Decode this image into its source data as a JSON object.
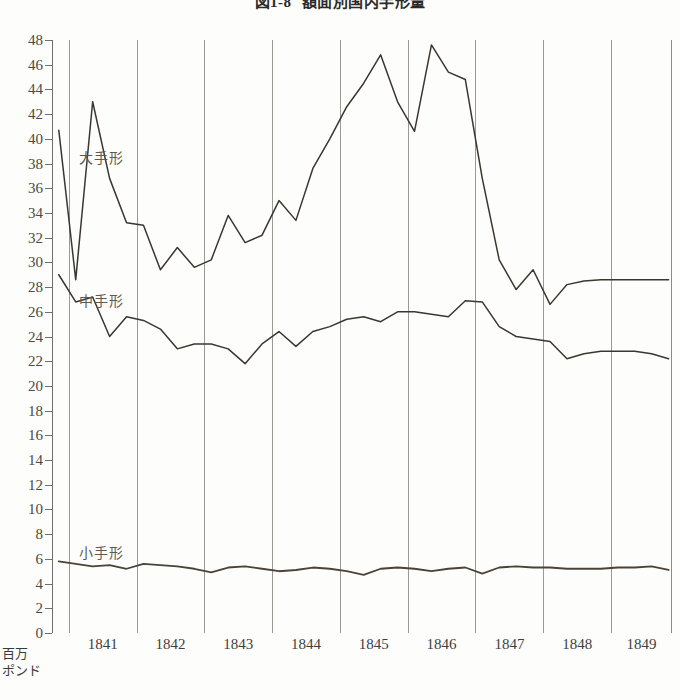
{
  "figure": {
    "title_number": "図1-8",
    "title_text": "額面別国内手形量",
    "unit_line1": "百万",
    "unit_line2": "ポンド"
  },
  "chart_data": {
    "type": "line",
    "xlabel": "",
    "ylabel": "百万ポンド",
    "ylim": [
      0,
      48
    ],
    "ytick_step": 2,
    "ytick_labels": [
      "0",
      "2",
      "4",
      "6",
      "8",
      "10",
      "12",
      "14",
      "16",
      "18",
      "20",
      "22",
      "24",
      "26",
      "28",
      "30",
      "32",
      "34",
      "36",
      "38",
      "40",
      "42",
      "44",
      "46",
      "48"
    ],
    "xlim": [
      1840.75,
      1849.9
    ],
    "categories": [
      "1841",
      "1842",
      "1843",
      "1844",
      "1845",
      "1846",
      "1847",
      "1848",
      "1849"
    ],
    "grid": "vertical-year-boundaries",
    "legend": "inline-labels",
    "series": [
      {
        "name": "大手形",
        "label_x": 1841.15,
        "label_y": 38.6,
        "color": "#3b3630",
        "x": [
          1840.85,
          1841.1,
          1841.35,
          1841.6,
          1841.85,
          1842.1,
          1842.35,
          1842.6,
          1842.85,
          1843.1,
          1843.35,
          1843.6,
          1843.85,
          1844.1,
          1844.35,
          1844.6,
          1844.85,
          1845.1,
          1845.35,
          1845.6,
          1845.85,
          1846.1,
          1846.35,
          1846.6,
          1846.85,
          1847.1,
          1847.35,
          1847.6,
          1847.85,
          1848.1,
          1848.35,
          1848.6,
          1848.85,
          1849.1,
          1849.35,
          1849.6,
          1849.85
        ],
        "values": [
          40.7,
          28.6,
          43.0,
          36.8,
          33.2,
          33.0,
          29.4,
          31.2,
          29.6,
          30.2,
          33.8,
          31.6,
          32.2,
          35.0,
          33.4,
          37.6,
          40.0,
          42.6,
          44.5,
          46.8,
          43.0,
          40.6,
          47.6,
          45.4,
          44.8,
          36.8,
          30.2,
          27.8,
          29.4,
          26.6,
          28.2,
          28.5,
          28.6,
          28.6,
          28.6,
          28.6,
          28.6
        ]
      },
      {
        "name": "中手形",
        "label_x": 1841.15,
        "label_y": 27.0,
        "color": "#3b3630",
        "x": [
          1840.85,
          1841.1,
          1841.35,
          1841.6,
          1841.85,
          1842.1,
          1842.35,
          1842.6,
          1842.85,
          1843.1,
          1843.35,
          1843.6,
          1843.85,
          1844.1,
          1844.35,
          1844.6,
          1844.85,
          1845.1,
          1845.35,
          1845.6,
          1845.85,
          1846.1,
          1846.35,
          1846.6,
          1846.85,
          1847.1,
          1847.35,
          1847.6,
          1847.85,
          1848.1,
          1848.35,
          1848.6,
          1848.85,
          1849.1,
          1849.35,
          1849.6,
          1849.85
        ],
        "values": [
          29.0,
          26.8,
          27.2,
          24.0,
          25.6,
          25.3,
          24.6,
          23.0,
          23.4,
          23.4,
          23.0,
          21.8,
          23.4,
          24.4,
          23.2,
          24.4,
          24.8,
          25.4,
          25.6,
          25.2,
          26.0,
          26.0,
          25.8,
          25.6,
          26.9,
          26.8,
          24.8,
          24.0,
          23.8,
          23.6,
          22.2,
          22.6,
          22.8,
          22.8,
          22.8,
          22.6,
          22.2
        ]
      },
      {
        "name": "小手形",
        "label_x": 1841.15,
        "label_y": 6.6,
        "color": "#4a4338",
        "x": [
          1840.85,
          1841.1,
          1841.35,
          1841.6,
          1841.85,
          1842.1,
          1842.35,
          1842.6,
          1842.85,
          1843.1,
          1843.35,
          1843.6,
          1843.85,
          1844.1,
          1844.35,
          1844.6,
          1844.85,
          1845.1,
          1845.35,
          1845.6,
          1845.85,
          1846.1,
          1846.35,
          1846.6,
          1846.85,
          1847.1,
          1847.35,
          1847.6,
          1847.85,
          1848.1,
          1848.35,
          1848.6,
          1848.85,
          1849.1,
          1849.35,
          1849.6,
          1849.85
        ],
        "values": [
          5.8,
          5.6,
          5.4,
          5.5,
          5.2,
          5.6,
          5.5,
          5.4,
          5.2,
          4.9,
          5.3,
          5.4,
          5.2,
          5.0,
          5.1,
          5.3,
          5.2,
          5.0,
          4.7,
          5.2,
          5.3,
          5.2,
          5.0,
          5.2,
          5.3,
          4.8,
          5.3,
          5.4,
          5.3,
          5.3,
          5.2,
          5.2,
          5.2,
          5.3,
          5.3,
          5.4,
          5.1
        ]
      }
    ]
  }
}
